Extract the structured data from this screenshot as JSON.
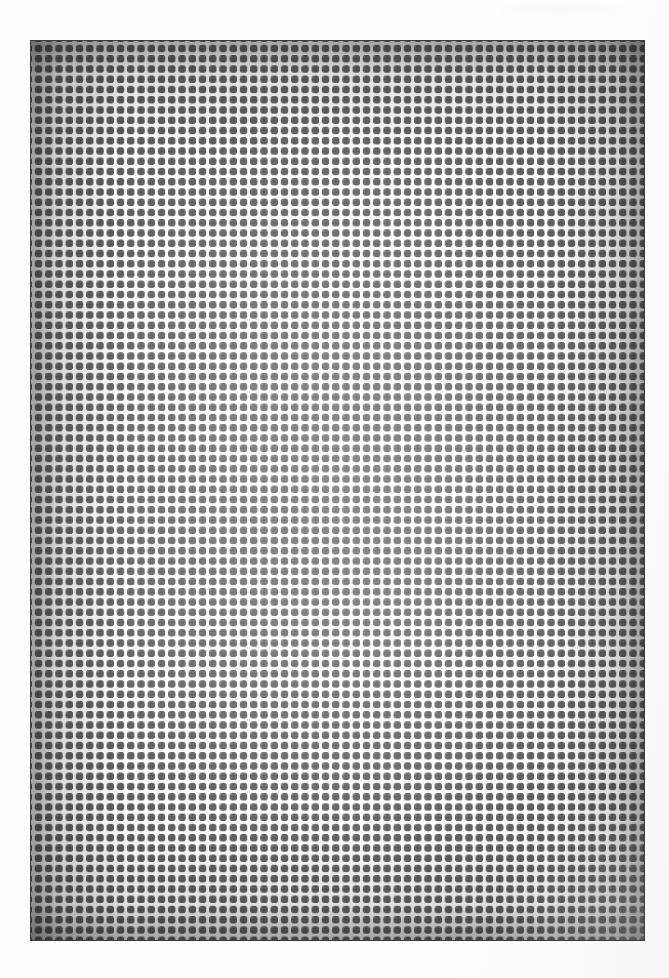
{
  "document": {
    "kind": "scanned-image",
    "subject": "halftone mesh plate",
    "background_color": "#ffffff",
    "width": 669,
    "height": 978,
    "caption": "",
    "title": "",
    "text_content": []
  },
  "plate": {
    "name": "halftone-mesh-plate",
    "x": 30,
    "y": 40,
    "width": 615,
    "height": 901,
    "substrate_color": "#545658",
    "dot_color": "#ffffff",
    "border_color": "#3a3c3e",
    "motif": "plus-cross",
    "cell_pitch_px": 10.25,
    "columns": 60,
    "rows": 88,
    "tone": {
      "edges": "dark, high contrast",
      "center": "lighter, washed out",
      "vignette_color": "#19191b"
    }
  },
  "artifacts": {
    "scan_smudge": {
      "name": "scan-smudge",
      "x": 498,
      "y": 1,
      "width": 126,
      "height": 16,
      "color": "#f6f6f7"
    },
    "paper_tint": {
      "name": "paper-tint",
      "edge": "right",
      "color": "#f5f5f7"
    }
  }
}
